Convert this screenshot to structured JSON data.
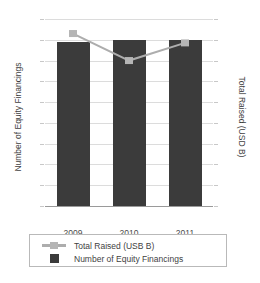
{
  "chart_data": {
    "type": "bar",
    "title": "Canada Trends",
    "categories": [
      "2009",
      "2010",
      "2011"
    ],
    "series": [
      {
        "name": "Number of Equity Financings",
        "type": "bar",
        "axis": "left",
        "values": [
          790,
          800,
          800
        ],
        "color": "#3b3b3b"
      },
      {
        "name": "Total Raised (USB B)",
        "type": "line",
        "axis": "right",
        "values": [
          16.6,
          14.0,
          15.7
        ],
        "color": "#adadad"
      }
    ],
    "xlabel": "",
    "ylabel": "Number of Equity Financings",
    "y2label": "Total Raised (USD B)",
    "ylim": [
      0,
      900
    ],
    "y2lim": [
      0,
      18
    ],
    "yticks": [
      "0",
      "100",
      "200",
      "300",
      "400",
      "500",
      "600",
      "700",
      "800",
      "900"
    ],
    "y2ticks": [
      "0",
      "2",
      "4",
      "6",
      "8",
      "10",
      "12",
      "14",
      "16",
      "18"
    ],
    "grid": true,
    "legend_position": "bottom"
  },
  "axes": {
    "left": {
      "title": "Number of Equity Financings",
      "ticks": [
        {
          "label": "900",
          "value": 900
        },
        {
          "label": "800",
          "value": 800
        },
        {
          "label": "700",
          "value": 700
        },
        {
          "label": "600",
          "value": 600
        },
        {
          "label": "500",
          "value": 500
        },
        {
          "label": "400",
          "value": 400
        },
        {
          "label": "300",
          "value": 300
        },
        {
          "label": "200",
          "value": 200
        },
        {
          "label": "100",
          "value": 100
        },
        {
          "label": "0",
          "value": 0
        }
      ]
    },
    "right": {
      "title": "Total Raised (USD B)",
      "ticks": [
        {
          "label": "18",
          "value": 18
        },
        {
          "label": "16",
          "value": 16
        },
        {
          "label": "14",
          "value": 14
        },
        {
          "label": "12",
          "value": 12
        },
        {
          "label": "10",
          "value": 10
        },
        {
          "label": "8",
          "value": 8
        },
        {
          "label": "6",
          "value": 6
        },
        {
          "label": "4",
          "value": 4
        },
        {
          "label": "2",
          "value": 2
        },
        {
          "label": "0",
          "value": 0
        }
      ]
    },
    "x": {
      "ticks": [
        {
          "label": "2009"
        },
        {
          "label": "2010"
        },
        {
          "label": "2011"
        }
      ]
    }
  },
  "legend": {
    "items": [
      {
        "label": "Total Raised (USB B)",
        "marker": "line-square",
        "color": "#adadad"
      },
      {
        "label": "Number of Equity Financings",
        "marker": "square",
        "color": "#3b3b3b"
      }
    ]
  },
  "colors": {
    "bar": "#3b3b3b",
    "line": "#adadad",
    "grid": "#dcdcdc",
    "axis": "#9a9a9a",
    "text": "#3f3f3f"
  }
}
